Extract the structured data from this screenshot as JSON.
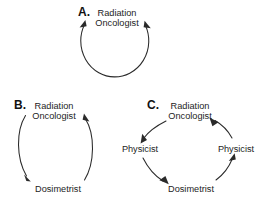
{
  "figure": {
    "background_color": "#ffffff",
    "stroke_color": "#2a2a2a",
    "text_color": "#1d1d1d",
    "width": 262,
    "height": 208
  },
  "panels": [
    {
      "id": "A",
      "letter": "A.",
      "kind": "self-loop-cycle",
      "nodes": [
        {
          "id": "a-ro",
          "line1": "Radiation",
          "line2": "Oncologist"
        }
      ],
      "arrow_count": 2,
      "description": "Single closed loop returning to Radiation Oncologist"
    },
    {
      "id": "B",
      "letter": "B.",
      "kind": "two-node-cycle",
      "nodes": [
        {
          "id": "b-ro",
          "line1": "Radiation",
          "line2": "Oncologist"
        },
        {
          "id": "b-dos",
          "line1": "Dosimetrist",
          "line2": ""
        }
      ],
      "arrow_count": 2,
      "description": "Radiation Oncologist to Dosimetrist and back"
    },
    {
      "id": "C",
      "letter": "C.",
      "kind": "four-node-cycle",
      "nodes": [
        {
          "id": "c-ro",
          "line1": "Radiation",
          "line2": "Oncologist"
        },
        {
          "id": "c-phys-left",
          "line1": "Physicist",
          "line2": ""
        },
        {
          "id": "c-dos",
          "line1": "Dosimetrist",
          "line2": ""
        },
        {
          "id": "c-phys-right",
          "line1": "Physicist",
          "line2": ""
        }
      ],
      "arrow_count": 4,
      "description": "Radiation Oncologist to Physicist to Dosimetrist to Physicist back to Radiation Oncologist"
    }
  ]
}
